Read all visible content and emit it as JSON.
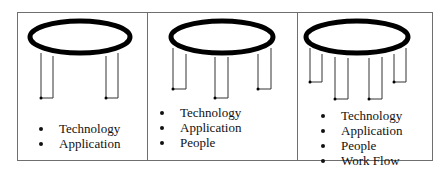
{
  "diagram": {
    "type": "table-with-legs metaphor",
    "panels": [
      {
        "id": "two-legs",
        "legs": 2,
        "items": [
          "Technology",
          "Application"
        ]
      },
      {
        "id": "three-legs",
        "legs": 3,
        "items": [
          "Technology",
          "Application",
          "People"
        ]
      },
      {
        "id": "four-legs",
        "legs": 4,
        "items": [
          "Technology",
          "Application",
          "People",
          "Work Flow"
        ]
      }
    ],
    "colors": {
      "ring": "#000000",
      "lines": "#333333",
      "border": "#6f6f6f",
      "text": "#111111"
    }
  }
}
